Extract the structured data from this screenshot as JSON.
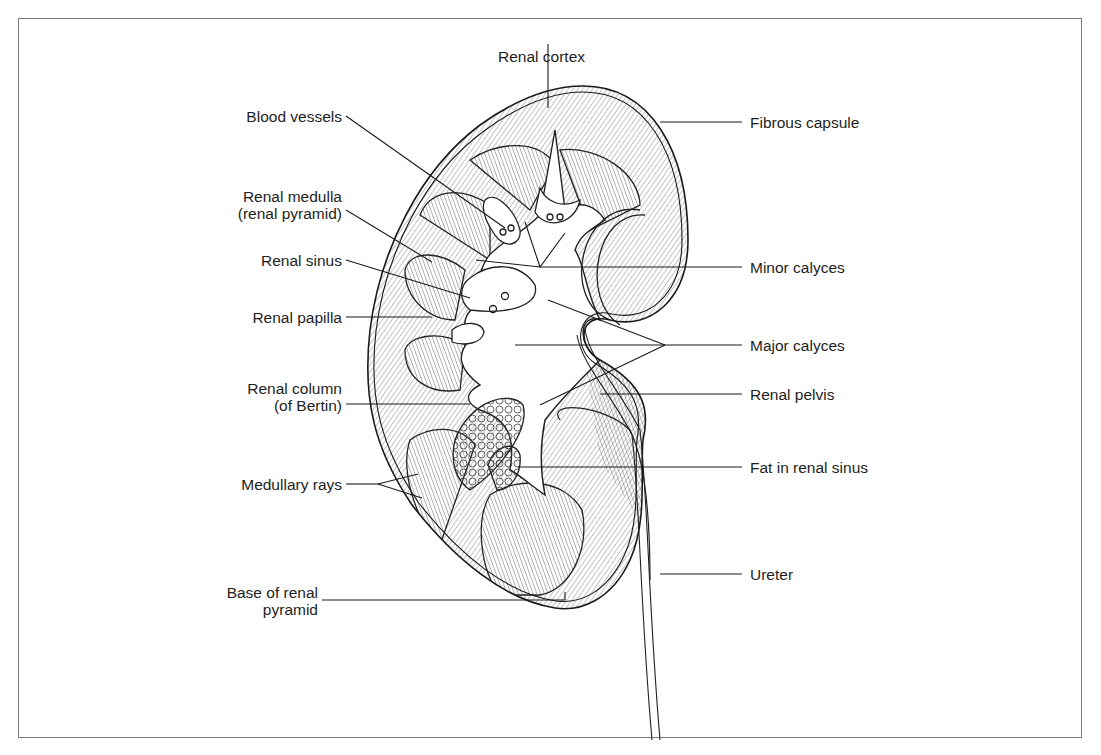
{
  "figure": {
    "type": "anatomical-diagram"
  },
  "labels": {
    "renal_cortex": "Renal cortex",
    "fibrous_capsule": "Fibrous capsule",
    "blood_vessels": "Blood vessels",
    "renal_medulla_line1": "Renal medulla",
    "renal_medulla_line2": "(renal pyramid)",
    "minor_calyces": "Minor calyces",
    "renal_sinus": "Renal sinus",
    "renal_papilla": "Renal papilla",
    "major_calyces": "Major calyces",
    "renal_column_line1": "Renal column",
    "renal_column_line2": "(of Bertin)",
    "renal_pelvis": "Renal pelvis",
    "fat_in_renal_sinus": "Fat in renal sinus",
    "medullary_rays": "Medullary rays",
    "ureter": "Ureter",
    "base_of_pyramid_line1": "Base of renal",
    "base_of_pyramid_line2": "pyramid"
  },
  "colors": {
    "line": "#1a1a1a",
    "frame": "#7a7a7a",
    "background": "#ffffff"
  }
}
